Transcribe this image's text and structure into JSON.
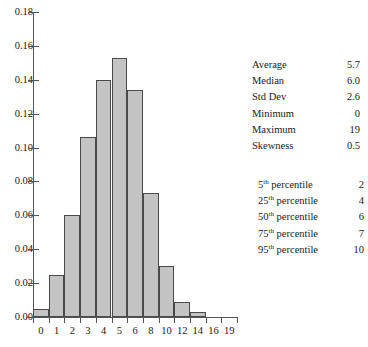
{
  "chart_data": {
    "type": "bar",
    "title": "",
    "xlabel": "",
    "ylabel": "",
    "ylim": [
      0.0,
      0.18
    ],
    "grid": false,
    "legend": false,
    "categories": [
      "0",
      "1",
      "2",
      "3",
      "4",
      "5",
      "6",
      "8",
      "10",
      "12",
      "14",
      "16",
      "19"
    ],
    "values": [
      0.005,
      0.025,
      0.06,
      0.106,
      0.14,
      0.153,
      0.134,
      0.073,
      0.03,
      0.009,
      0.003,
      0.0,
      0.0
    ],
    "y_ticks": [
      "0.00",
      "0.02",
      "0.04",
      "0.06",
      "0.08",
      "0.10",
      "0.12",
      "0.14",
      "0.16",
      "0.18"
    ],
    "y_tick_values": [
      0.0,
      0.02,
      0.04,
      0.06,
      0.08,
      0.1,
      0.12,
      0.14,
      0.16,
      0.18
    ],
    "x_tick_labels": [
      "0",
      "1",
      "2",
      "3",
      "4",
      "5",
      "6",
      "8",
      "10",
      "12",
      "14",
      "16",
      "19"
    ],
    "bar_color": "#c4c4c4",
    "bar_edge_color": "#4a4a4a",
    "axis_color": "#555555"
  },
  "title_fragment": "",
  "summary_stats": {
    "rows": [
      {
        "label": "Average",
        "value": "5.7"
      },
      {
        "label": "Median",
        "value": "6.0"
      },
      {
        "label": "Std Dev",
        "value": "2.6"
      },
      {
        "label": "Minimum",
        "value": "0"
      },
      {
        "label": "Maximum",
        "value": "19"
      },
      {
        "label": "Skewness",
        "value": "0.5"
      }
    ]
  },
  "percentile_stats": {
    "rows": [
      {
        "number": "5",
        "ordinal": "th",
        "label": " percentile",
        "value": "2"
      },
      {
        "number": "25",
        "ordinal": "th",
        "label": " percentile",
        "value": "4"
      },
      {
        "number": "50",
        "ordinal": "th",
        "label": " percentile",
        "value": "6"
      },
      {
        "number": "75",
        "ordinal": "th",
        "label": " percentile",
        "value": "7"
      },
      {
        "number": "95",
        "ordinal": "th",
        "label": " percentile",
        "value": "10"
      }
    ]
  }
}
